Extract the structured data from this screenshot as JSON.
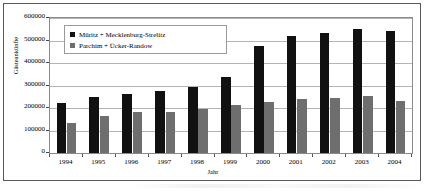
{
  "chart_data": {
    "type": "bar",
    "title": "",
    "xlabel": "Jahr",
    "ylabel": "Gästeankünfte",
    "categories": [
      "1994",
      "1995",
      "1996",
      "1997",
      "1998",
      "1999",
      "2000",
      "2001",
      "2002",
      "2003",
      "2004"
    ],
    "series": [
      {
        "name": "Müritz + Mecklenburg-Strelitz",
        "color": "#111111",
        "values": [
          222000,
          247000,
          262000,
          275000,
          295000,
          337000,
          477000,
          519000,
          535000,
          550000,
          542000
        ]
      },
      {
        "name": "Parchim + Ücker-Randow",
        "color": "#6e6e6e",
        "values": [
          133000,
          165000,
          183000,
          182000,
          194000,
          212000,
          228000,
          238000,
          243000,
          255000,
          233000
        ]
      }
    ],
    "ylim": [
      0,
      600000
    ],
    "ytick_values": [
      0,
      100000,
      200000,
      300000,
      400000,
      500000,
      600000
    ],
    "ytick_labels": [
      "0",
      "100000",
      "200000",
      "300000",
      "400000",
      "500000",
      "600000"
    ],
    "grid": true,
    "legend_position": "top-left-inside"
  },
  "legend": {
    "items": [
      {
        "label": "Müritz + Mecklenburg-Strelitz",
        "swatch": "legend-swatch-dark"
      },
      {
        "label": "Parchim + Ücker-Randow",
        "swatch": "legend-swatch-grey"
      }
    ]
  },
  "axes": {
    "y_title": "Gästeankünfte",
    "x_title": "Jahr"
  }
}
